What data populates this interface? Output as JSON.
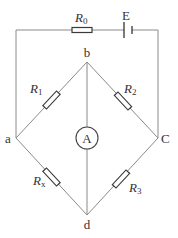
{
  "diagram": {
    "type": "wheatstone-bridge-circuit",
    "colors": {
      "wire": "#8a8a8a",
      "component": "#3a3a3a",
      "text": "#333333"
    },
    "nodes": {
      "a": "a",
      "b": "b",
      "c": "C",
      "d": "d"
    },
    "components": {
      "r0": {
        "symbol": "R",
        "subscript": "0"
      },
      "battery": {
        "label": "E"
      },
      "r1": {
        "symbol": "R",
        "subscript": "1"
      },
      "r2": {
        "symbol": "R",
        "subscript": "2"
      },
      "rx": {
        "symbol": "R",
        "subscript": "x"
      },
      "r3": {
        "symbol": "R",
        "subscript": "3"
      },
      "ammeter": {
        "label": "A"
      }
    },
    "caption": ""
  }
}
